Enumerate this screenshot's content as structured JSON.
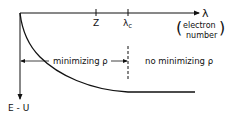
{
  "axes": {
    "x_label": "λ",
    "x_caption_line1": "electron",
    "x_caption_line2": "number",
    "y_label": "E - U",
    "ticks": [
      {
        "label": "Z",
        "position": "Z"
      },
      {
        "label": "λ",
        "subscript": "c",
        "position": "critical"
      }
    ]
  },
  "regions": {
    "left_label": "minimizing ρ",
    "right_label": "no minimizing ρ"
  },
  "curve": {
    "description": "E - U decreasing in λ, reaching constant for λ ≥ λc"
  },
  "colors": {
    "ink": "#111111",
    "background": "#ffffff"
  }
}
